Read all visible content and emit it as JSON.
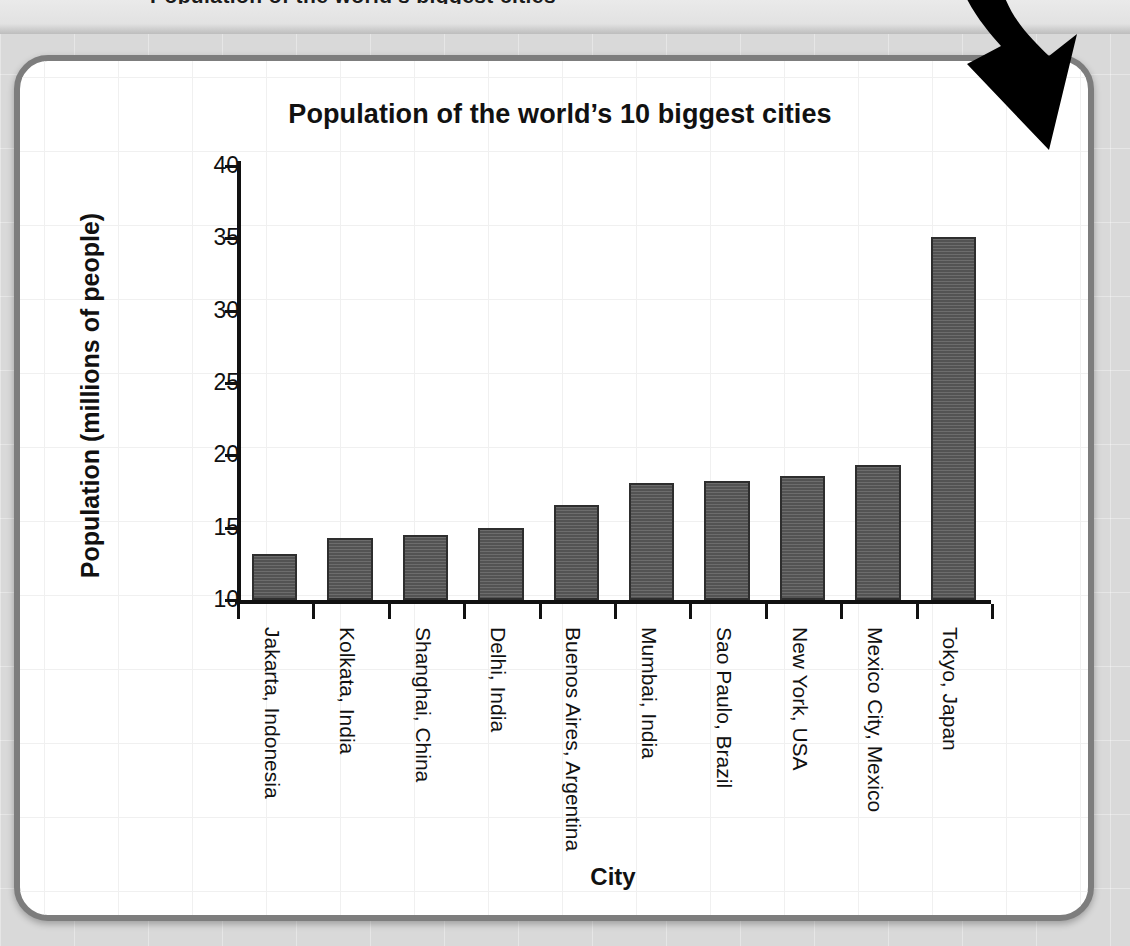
{
  "page": {
    "background_color": "#d9d9d9",
    "panel_border_color": "#7d7d7d",
    "clipped_top_text": "Population of the world's biggest cities"
  },
  "annotation": {
    "arrow_icon": "curved-down-arrow",
    "color": "#000000"
  },
  "chart_data": {
    "type": "bar",
    "title": "Population of the world’s 10 biggest cities",
    "xlabel": "City",
    "ylabel": "Population (millions of people)",
    "categories": [
      "Jakarta, Indonesia",
      "Kolkata, India",
      "Shanghai, China",
      "Delhi, India",
      "Buenos Aires, Argentina",
      "Mumbai, India",
      "Sao Paulo, Brazil",
      "New York, USA",
      "Mexico City, Mexico",
      "Tokyo, Japan"
    ],
    "values": [
      13.2,
      14.3,
      14.5,
      15.0,
      16.6,
      18.1,
      18.2,
      18.6,
      19.3,
      35.1
    ],
    "ylim": [
      10,
      40
    ],
    "ytick_labels": [
      "10",
      "15",
      "20",
      "25",
      "30",
      "35",
      "40"
    ],
    "yticks": [
      10,
      15,
      20,
      25,
      30,
      35,
      40
    ],
    "grid": true,
    "legend": "none",
    "bar_color": "#5c5c5c",
    "bar_edge_color": "#2e2e2e"
  }
}
